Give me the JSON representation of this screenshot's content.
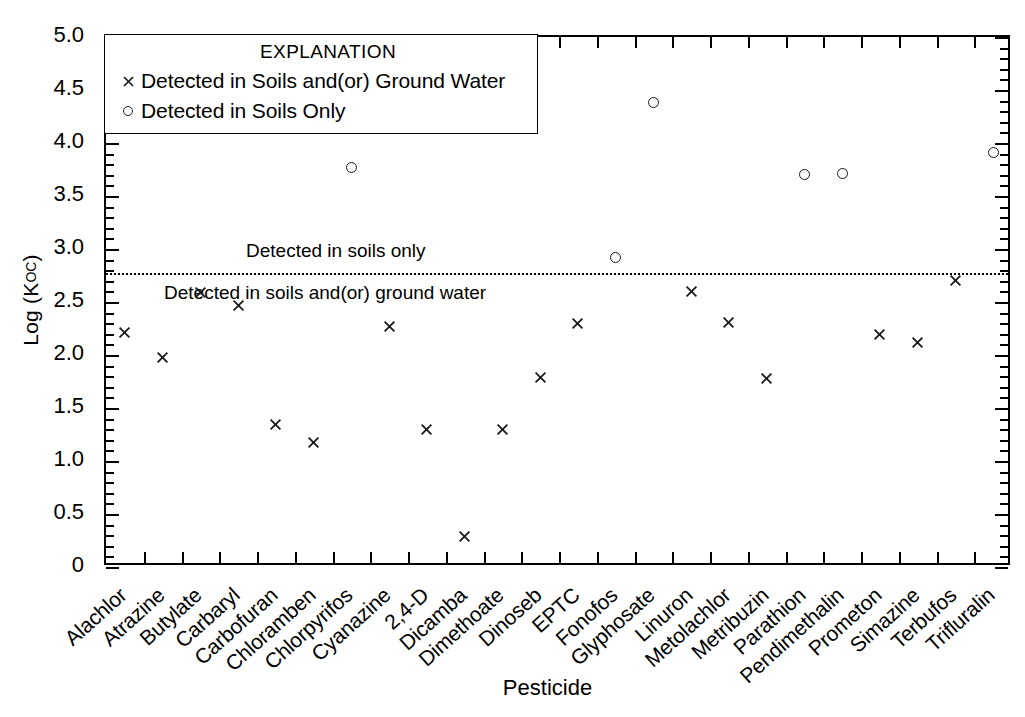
{
  "figure": {
    "x_axis_title": "Pesticide",
    "y_axis_title_main": "Log (K",
    "y_axis_title_sub": "OC",
    "y_axis_title_close": ")"
  },
  "legend": {
    "title": "EXPLANATION",
    "entries": [
      {
        "symbol": "cross-marker-icon",
        "label": "Detected in Soils and(or) Ground Water"
      },
      {
        "symbol": "circle-marker-icon",
        "label": "Detected in Soils Only"
      }
    ]
  },
  "annotations": {
    "above_line": "Detected in soils only",
    "below_line": "Detected in soils and(or) ground water",
    "threshold_value": 2.77
  },
  "colors": {
    "axis": "#000000",
    "marker": "#1a1a1a",
    "background": "#ffffff"
  },
  "chart_data": {
    "type": "scatter",
    "title": "",
    "xlabel": "Pesticide",
    "ylabel": "Log (Koc)",
    "ylim": [
      0,
      5.0
    ],
    "ytick_labels": [
      "0",
      "0.5",
      "1.0",
      "1.5",
      "2.0",
      "2.5",
      "3.0",
      "3.5",
      "4.0",
      "4.5",
      "5.0"
    ],
    "ytick_values": [
      0,
      0.5,
      1.0,
      1.5,
      2.0,
      2.5,
      3.0,
      3.5,
      4.0,
      4.5,
      5.0
    ],
    "yminor_step": 0.1,
    "grid": false,
    "legend_position": "upper-left-inside",
    "threshold_line": {
      "value": 2.77,
      "style": "dotted"
    },
    "categories": [
      "Alachlor",
      "Atrazine",
      "Butylate",
      "Carbaryl",
      "Carbofuran",
      "Chloramben",
      "Chlorpyrifos",
      "Cyanazine",
      "2,4-D",
      "Dicamba",
      "Dimethoate",
      "Dinoseb",
      "EPTC",
      "Fonofos",
      "Glyphosate",
      "Linuron",
      "Metolachlor",
      "Metribuzin",
      "Parathion",
      "Pendimethalin",
      "Prometon",
      "Simazine",
      "Terbufos",
      "Trifluralin"
    ],
    "series": [
      {
        "name": "Detected in Soils and(or) Ground Water",
        "marker": "x",
        "points": [
          {
            "category": "Alachlor",
            "value": 2.21
          },
          {
            "category": "Atrazine",
            "value": 1.98
          },
          {
            "category": "Butylate",
            "value": 2.59
          },
          {
            "category": "Carbaryl",
            "value": 2.47
          },
          {
            "category": "Carbofuran",
            "value": 1.34
          },
          {
            "category": "Chloramben",
            "value": 1.17
          },
          {
            "category": "Cyanazine",
            "value": 2.27
          },
          {
            "category": "2,4-D",
            "value": 1.3
          },
          {
            "category": "Dicamba",
            "value": 0.29
          },
          {
            "category": "Dimethoate",
            "value": 1.3
          },
          {
            "category": "Dinoseb",
            "value": 1.79
          },
          {
            "category": "EPTC",
            "value": 2.3
          },
          {
            "category": "Linuron",
            "value": 2.6
          },
          {
            "category": "Metolachlor",
            "value": 2.31
          },
          {
            "category": "Metribuzin",
            "value": 1.78
          },
          {
            "category": "Prometon",
            "value": 2.19
          },
          {
            "category": "Simazine",
            "value": 2.12
          },
          {
            "category": "Terbufos",
            "value": 2.7
          }
        ]
      },
      {
        "name": "Detected in Soils Only",
        "marker": "o",
        "points": [
          {
            "category": "Chlorpyrifos",
            "value": 3.77
          },
          {
            "category": "Fonofos",
            "value": 2.92
          },
          {
            "category": "Glyphosate",
            "value": 4.38
          },
          {
            "category": "Parathion",
            "value": 3.7
          },
          {
            "category": "Pendimethalin",
            "value": 3.71
          },
          {
            "category": "Trifluralin",
            "value": 3.91
          }
        ]
      }
    ]
  }
}
